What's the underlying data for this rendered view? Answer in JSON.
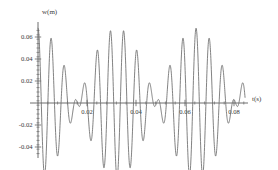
{
  "chart_data": {
    "type": "line",
    "title": "",
    "xlabel": "t(s)",
    "ylabel": "w(m)",
    "xlim": [
      0,
      0.085
    ],
    "ylim": [
      -0.048,
      0.072
    ],
    "grid": false,
    "legend": null,
    "xticks": [
      0.02,
      0.04,
      0.06,
      0.08
    ],
    "xtick_labels": [
      "0.02",
      "0.04",
      "0.06",
      "0.08"
    ],
    "yticks": [
      0.06,
      0.04,
      0.02,
      -0.02,
      -0.04
    ],
    "ytick_labels": [
      "0.06",
      "0.04",
      "0.02",
      "-0.02",
      "-0.04"
    ],
    "series": [
      {
        "name": "w(t)",
        "color": "#6b6b6b",
        "beat_model": {
          "amplitude": 0.034,
          "f_carrier_hz": 186,
          "f_modulation_hz": 31,
          "phase_carrier": 1.5707963,
          "phase_modulation": 0.0
        },
        "key_points": {
          "start_value": 0.07,
          "major_peaks_t": [
            0.0,
            0.0132,
            0.029,
            0.0452,
            0.0583,
            0.0733
          ],
          "major_peaks_w": [
            0.07,
            0.052,
            0.047,
            0.066,
            0.056,
            0.042
          ],
          "major_troughs_t": [
            0.0075,
            0.0212,
            0.0368,
            0.0508,
            0.0655,
            0.0805
          ],
          "major_troughs_w": [
            -0.03,
            -0.041,
            -0.04,
            -0.033,
            -0.042,
            -0.038
          ],
          "secondary_humps_t": [
            0.0098,
            0.0395,
            0.054,
            0.069
          ],
          "secondary_humps_w": [
            -0.022,
            -0.023,
            -0.021,
            -0.024
          ]
        }
      }
    ]
  },
  "axes": {
    "y_axis_label": "w(m)",
    "x_axis_label": "t(s)"
  }
}
